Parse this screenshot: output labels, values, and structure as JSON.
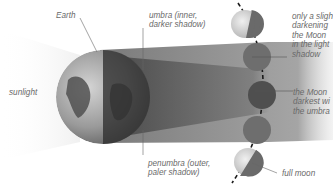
{
  "labels": {
    "earth": "Earth",
    "umbra": "umbra (inner,\ndarker shadow)",
    "sunlight": "sunlight",
    "penumbra": "penumbra (outer,\npaler shadow)",
    "slight_darkening": "only a sligh\ndarkening\nthe Moon\nin the light\nshadow",
    "darkest": "the Moon\ndarkest wi\nthe umbra",
    "full_moon": "full moon"
  },
  "moon_phases": [
    {
      "position": 1,
      "state": "partly lit, entering penumbra"
    },
    {
      "position": 2,
      "state": "in penumbra"
    },
    {
      "position": 3,
      "state": "in umbra (darkest)"
    },
    {
      "position": 4,
      "state": "in penumbra"
    },
    {
      "position": 5,
      "state": "full moon, partly lit"
    }
  ],
  "colors": {
    "sunlight": "#f2f2f2",
    "penumbra": "#9a9a9a",
    "umbra": "#5a5a5a",
    "moon_dark": "#6e6e6e",
    "label_text": "#6a6a6a"
  }
}
